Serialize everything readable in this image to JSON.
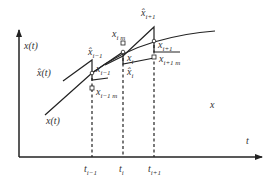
{
  "figure": {
    "axes": {
      "y_label": "x(t)",
      "x_label": "t",
      "region_label": "x"
    },
    "curves": {
      "true_label": "x(t)",
      "estimate_label": "x̂(t)"
    },
    "time_ticks": [
      {
        "base": "t",
        "sub": "i−1"
      },
      {
        "base": "t",
        "sub": "i"
      },
      {
        "base": "t",
        "sub": "i+1"
      }
    ],
    "points": {
      "xhat_prev": {
        "base": "x̂",
        "sub": "i−1"
      },
      "x_prev": {
        "base": "x",
        "sub": "i−1"
      },
      "x_prev_m": {
        "base": "x",
        "sub": "i−1 m"
      },
      "x_i_m": {
        "base": "x",
        "sub": "i m"
      },
      "x_i": {
        "base": "x",
        "sub": "i"
      },
      "xhat_i": {
        "base": "x̂",
        "sub": "i"
      },
      "xhat_next": {
        "base": "x̂",
        "sub": "i+1"
      },
      "x_next": {
        "base": "x",
        "sub": "i+1"
      },
      "x_next_m": {
        "base": "x",
        "sub": "i+1 m"
      }
    },
    "colors": {
      "line": "#222222",
      "text": "#333333"
    }
  }
}
